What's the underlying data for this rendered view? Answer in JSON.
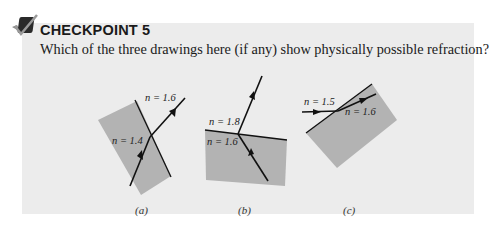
{
  "header": {
    "icon": "checkmark-icon",
    "title": "CHECKPOINT 5"
  },
  "question": "Which of the three drawings here (if any) show physically possible refraction?",
  "figures": [
    {
      "id": "a",
      "caption": "(a)",
      "n_outer": "n = 1.6",
      "n_inner": "n = 1.4"
    },
    {
      "id": "b",
      "caption": "(b)",
      "n_outer": "n = 1.8",
      "n_inner": "n = 1.6"
    },
    {
      "id": "c",
      "caption": "(c)",
      "n_outer": "n = 1.5",
      "n_inner": "n = 1.6"
    }
  ],
  "colors": {
    "panel": "#ececec",
    "block": "#b3b3b3",
    "line": "#111111"
  }
}
